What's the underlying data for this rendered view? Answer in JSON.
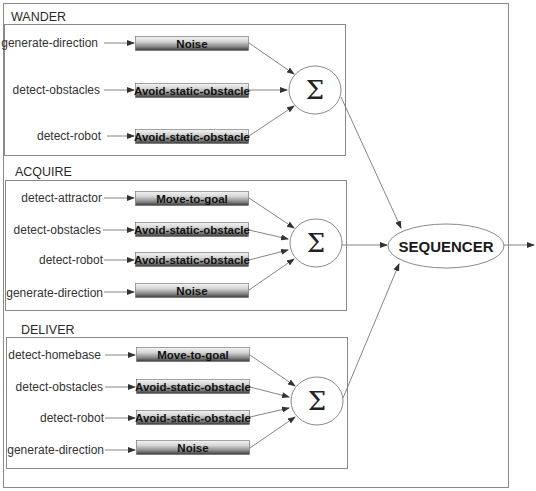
{
  "diagram": {
    "groups": [
      {
        "name": "WANDER",
        "rows": [
          {
            "input": "generate-direction",
            "behavior": "Noise"
          },
          {
            "input": "detect-obstacles",
            "behavior": "Avoid-static-obstacle"
          },
          {
            "input": "detect-robot",
            "behavior": "Avoid-static-obstacle"
          }
        ],
        "combiner": "Σ"
      },
      {
        "name": "ACQUIRE",
        "rows": [
          {
            "input": "detect-attractor",
            "behavior": "Move-to-goal"
          },
          {
            "input": "detect-obstacles",
            "behavior": "Avoid-static-obstacle"
          },
          {
            "input": "detect-robot",
            "behavior": "Avoid-static-obstacle"
          },
          {
            "input": "generate-direction",
            "behavior": "Noise"
          }
        ],
        "combiner": "Σ"
      },
      {
        "name": "DELIVER",
        "rows": [
          {
            "input": "detect-homebase",
            "behavior": "Move-to-goal"
          },
          {
            "input": "detect-obstacles",
            "behavior": "Avoid-static-obstacle"
          },
          {
            "input": "detect-robot",
            "behavior": "Avoid-static-obstacle"
          },
          {
            "input": "generate-direction",
            "behavior": "Noise"
          }
        ],
        "combiner": "Σ"
      }
    ],
    "sequencer": "SEQUENCER",
    "colors": {
      "button_top": "#f2f2f2",
      "button_mid": "#9a9a9a",
      "button_bottom": "#3a3a3a",
      "lines": "#777777",
      "borders": "#8a8a8a"
    }
  }
}
